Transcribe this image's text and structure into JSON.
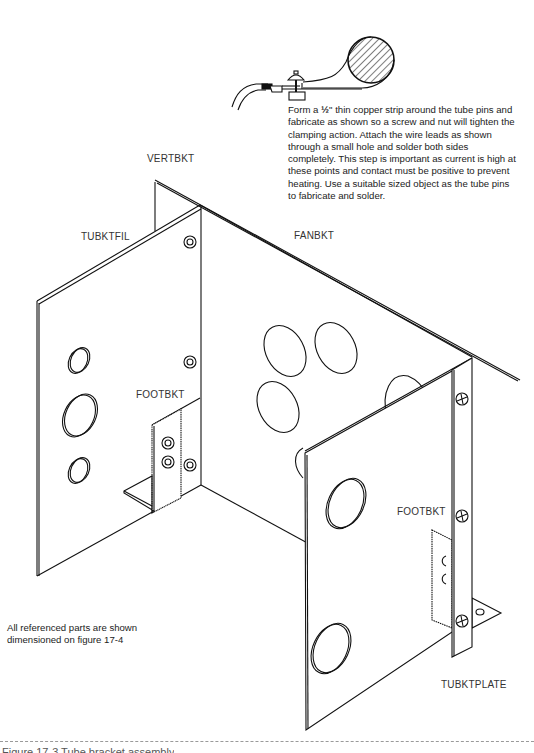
{
  "labels": {
    "vertbkt": "VERTBKT",
    "tubktfil": "TUBKTFIL",
    "fanbkt": "FANBKT",
    "footbkt_left": "FOOTBKT",
    "footbkt_right": "FOOTBKT",
    "tubktplate": "TUBKTPLATE"
  },
  "notes": {
    "clamp_prefix": "Form a ",
    "clamp_fraction": "½",
    "clamp_body": "\" thin copper strip around the tube pins and fabricate as shown so a screw and nut will tighten the clamping action.  Attach the wire leads as shown through a small hole and solder both sides completely.  This step is important as current is high at these points and contact must be positive to prevent heating.  Use a suitable sized object as the tube pins to fabricate and solder.",
    "reference_line1": "All referenced parts are shown",
    "reference_line2": "dimensioned on figure 17-4"
  },
  "footer": {
    "text": "Figure 17-3  Tube bracket assembly"
  },
  "diagram": {
    "type": "isometric-assembly",
    "parts": [
      "VERTBKT",
      "TUBKTFIL",
      "FANBKT",
      "FOOTBKT",
      "FOOTBKT",
      "TUBKTPLATE"
    ],
    "detail": "copper clamp strip around tube pin with screw, nut and wire lead"
  }
}
